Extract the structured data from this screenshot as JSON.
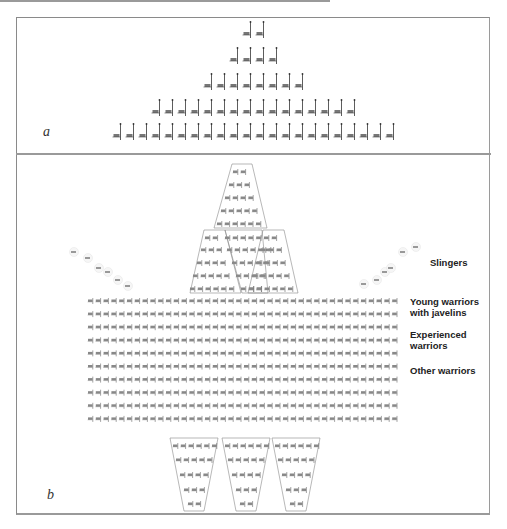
{
  "panels": {
    "a": {
      "label": "a",
      "rows": [
        {
          "count": 2,
          "y": 34
        },
        {
          "count": 4,
          "y": 60
        },
        {
          "count": 8,
          "y": 86
        },
        {
          "count": 16,
          "y": 112
        },
        {
          "count": 22,
          "y": 136
        }
      ],
      "center_x": 254,
      "spacing": 13
    },
    "b": {
      "label": "b",
      "legend": [
        {
          "text": "Slingers",
          "x": 430,
          "y": 262
        },
        {
          "text": "Young warriors\nwith javelins",
          "x": 410,
          "y": 298
        },
        {
          "text": "Experienced\nwarriors",
          "x": 410,
          "y": 330
        },
        {
          "text": "Other warriors",
          "x": 410,
          "y": 366
        }
      ],
      "main_block": {
        "rows": 10,
        "cols": 40,
        "x0": 91,
        "y0": 301,
        "dx": 7.8,
        "dy": 13.1
      },
      "slingers_left": [
        [
          74,
          252
        ],
        [
          88,
          258
        ],
        [
          99,
          268
        ],
        [
          108,
          272
        ],
        [
          118,
          280
        ],
        [
          128,
          286
        ]
      ],
      "slingers_right": [
        [
          364,
          284
        ],
        [
          377,
          280
        ],
        [
          385,
          272
        ],
        [
          391,
          268
        ],
        [
          403,
          252
        ],
        [
          416,
          247
        ]
      ]
    }
  }
}
